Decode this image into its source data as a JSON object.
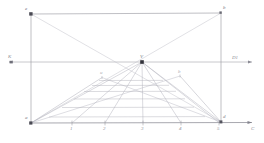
{
  "diagram": {
    "colors": {
      "frame_line": "#8f8f98",
      "construction_line": "#b9b9c2",
      "grid_line": "#a9a9b3",
      "ground_line": "#7d7d86",
      "point_marker": "#3a3a42",
      "label_text": "#8e8e96"
    },
    "points": {
      "top_left": {
        "label": "e",
        "x": 31,
        "y": 14
      },
      "top_right": {
        "label": "b",
        "x": 221,
        "y": 13
      },
      "bottom_left": {
        "label": "a",
        "x": 31,
        "y": 123
      },
      "bottom_right": {
        "label": "d",
        "x": 221,
        "y": 122
      },
      "vanishing_point": {
        "label": "V",
        "x": 142,
        "y": 62
      },
      "distance_point_left": {
        "label": "K",
        "x": 11,
        "y": 62
      },
      "distance_point_right": {
        "label": "D1",
        "x": 238,
        "y": 62
      },
      "grid_left_mark": {
        "label": "u",
        "x": 103,
        "y": 77
      },
      "grid_right_mark": {
        "label": "b",
        "x": 179,
        "y": 76
      },
      "horizon_axis_end": {
        "label": "",
        "x": 250,
        "y": 62
      },
      "ground_axis_end": {
        "label": "C",
        "x": 255,
        "y": 126
      }
    },
    "ground_divisions": [
      {
        "label": "1",
        "x": 72,
        "y": 130
      },
      {
        "label": "2",
        "x": 105,
        "y": 130
      },
      {
        "label": "3",
        "x": 143,
        "y": 130
      },
      {
        "label": "4",
        "x": 181,
        "y": 130
      },
      {
        "label": "5",
        "x": 219,
        "y": 130
      }
    ],
    "axes": {
      "horizon_label": "K",
      "horizon_right_label": "D1",
      "ground_right_label": "C"
    }
  }
}
